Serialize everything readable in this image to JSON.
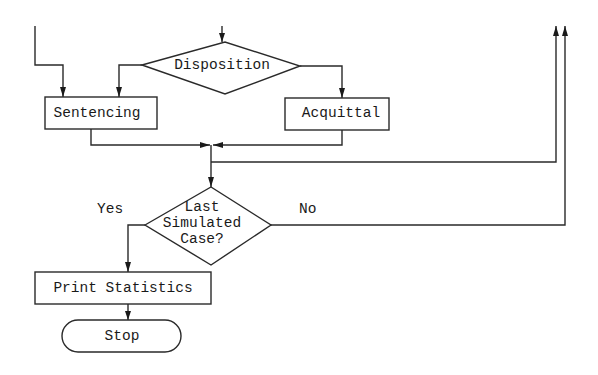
{
  "diagram": {
    "type": "flowchart",
    "nodes": {
      "disposition": {
        "label": "Disposition",
        "shape": "decision"
      },
      "sentencing": {
        "label": "Sentencing",
        "shape": "process"
      },
      "acquittal": {
        "label": "Acquittal",
        "shape": "process"
      },
      "last_case": {
        "label_lines": [
          "Last",
          "Simulated",
          "Case?"
        ],
        "shape": "decision"
      },
      "print_stats": {
        "label": "Print Statistics",
        "shape": "process"
      },
      "stop": {
        "label": "Stop",
        "shape": "terminator"
      }
    },
    "edge_labels": {
      "yes": "Yes",
      "no": "No"
    },
    "edges": [
      {
        "from": "offpage-top-left",
        "to": "sentencing"
      },
      {
        "from": "offpage-top-center",
        "to": "disposition"
      },
      {
        "from": "disposition",
        "to": "sentencing",
        "side": "left"
      },
      {
        "from": "disposition",
        "to": "acquittal",
        "side": "right"
      },
      {
        "from": "sentencing",
        "to": "junction"
      },
      {
        "from": "acquittal",
        "to": "junction"
      },
      {
        "from": "junction",
        "to": "offpage-top-right-1"
      },
      {
        "from": "junction",
        "to": "last_case"
      },
      {
        "from": "last_case",
        "to": "print_stats",
        "label": "Yes"
      },
      {
        "from": "last_case",
        "to": "offpage-top-right-2",
        "label": "No"
      },
      {
        "from": "print_stats",
        "to": "stop"
      }
    ],
    "colors": {
      "line": "#2a2a2a",
      "background": "#ffffff"
    }
  }
}
